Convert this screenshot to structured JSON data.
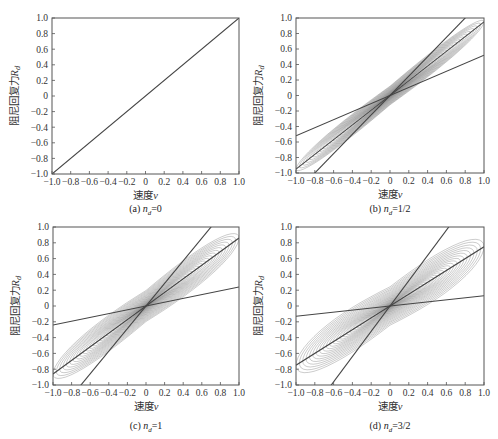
{
  "chart_data": [
    {
      "type": "line",
      "panel": "(a)",
      "caption_prefix": "(a)",
      "caption_var": "n",
      "caption_sub": "d",
      "caption_value": "=0",
      "xlabel": "速度v",
      "ylabel": "阻尼回复力R_d",
      "xlim": [
        -1.0,
        1.0
      ],
      "ylim": [
        -1.0,
        1.0
      ],
      "xticks": [
        "-1.0",
        "-0.8",
        "-0.6",
        "-0.4",
        "-0.2",
        "0",
        "0.2",
        "0.4",
        "0.6",
        "0.8",
        "1.0"
      ],
      "yticks": [
        "1.0",
        "0.8",
        "0.6",
        "0.4",
        "0.2",
        "0",
        "-0.2",
        "-0.4",
        "-0.6",
        "-0.8",
        "-1.0"
      ],
      "grid": false,
      "nd": 0,
      "lines": [
        {
          "name": "mean",
          "slope": 1.0
        }
      ],
      "has_loops": false
    },
    {
      "type": "line",
      "panel": "(b)",
      "caption_prefix": "(b)",
      "caption_var": "n",
      "caption_sub": "d",
      "caption_value": "=1/2",
      "xlabel": "速度v",
      "ylabel": "阻尼回复力R_d",
      "xlim": [
        -1.0,
        1.0
      ],
      "ylim": [
        -1.0,
        1.0
      ],
      "xticks": [
        "-1.0",
        "-0.8",
        "-0.6",
        "-0.4",
        "-0.2",
        "0",
        "0.2",
        "0.4",
        "0.6",
        "0.8",
        "1.0"
      ],
      "yticks": [
        "1.0",
        "0.8",
        "0.6",
        "0.4",
        "0.2",
        "0",
        "-0.2",
        "-0.4",
        "-0.6",
        "-0.8",
        "-1.0"
      ],
      "grid": false,
      "nd": 0.5,
      "lines": [
        {
          "name": "upper",
          "slope": 1.25
        },
        {
          "name": "mean",
          "slope": 0.95
        },
        {
          "name": "lower",
          "slope": 0.52
        }
      ],
      "has_loops": true
    },
    {
      "type": "line",
      "panel": "(c)",
      "caption_prefix": "(c)",
      "caption_var": "n",
      "caption_sub": "d",
      "caption_value": "=1",
      "xlabel": "速度v",
      "ylabel": "阻尼回复力R_d",
      "xlim": [
        -1.0,
        1.0
      ],
      "ylim": [
        -1.0,
        1.0
      ],
      "xticks": [
        "-1.0",
        "-0.8",
        "-0.6",
        "-0.4",
        "-0.2",
        "0",
        "0.2",
        "0.4",
        "0.6",
        "0.8",
        "1.0"
      ],
      "yticks": [
        "1.0",
        "0.8",
        "0.6",
        "0.4",
        "0.2",
        "0",
        "-0.2",
        "-0.4",
        "-0.6",
        "-0.8",
        "-1.0"
      ],
      "grid": false,
      "nd": 1,
      "lines": [
        {
          "name": "upper",
          "slope": 1.43
        },
        {
          "name": "mean",
          "slope": 0.86
        },
        {
          "name": "lower",
          "slope": 0.24
        }
      ],
      "has_loops": true
    },
    {
      "type": "line",
      "panel": "(d)",
      "caption_prefix": "(d)",
      "caption_var": "n",
      "caption_sub": "d",
      "caption_value": "=3/2",
      "xlabel": "速度v",
      "ylabel": "阻尼回复力R_d",
      "xlim": [
        -1.0,
        1.0
      ],
      "ylim": [
        -1.0,
        1.0
      ],
      "xticks": [
        "-1.0",
        "-0.8",
        "-0.6",
        "-0.4",
        "-0.2",
        "0",
        "0.2",
        "0.4",
        "0.6",
        "0.8",
        "1.0"
      ],
      "yticks": [
        "1.0",
        "0.8",
        "0.6",
        "0.4",
        "0.2",
        "0",
        "-0.2",
        "-0.4",
        "-0.6",
        "-0.8",
        "-1.0"
      ],
      "grid": false,
      "nd": 1.5,
      "lines": [
        {
          "name": "upper",
          "slope": 1.6
        },
        {
          "name": "mean",
          "slope": 0.75
        },
        {
          "name": "lower",
          "slope": 0.13
        }
      ],
      "has_loops": true
    }
  ],
  "labels": {
    "xlabel_text": "速度",
    "xlabel_var": "v",
    "ylabel_text": "阻尼回复力",
    "ylabel_var": "R",
    "ylabel_sub": "d"
  },
  "colors": {
    "axis": "#555555",
    "line": "#444444",
    "loop": "#777777"
  }
}
